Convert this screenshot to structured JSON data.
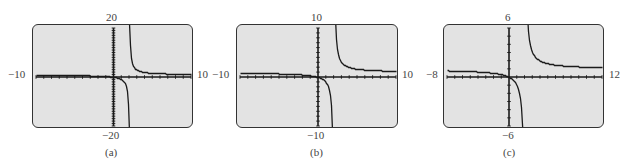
{
  "chart_data": [
    {
      "type": "line",
      "title": "(a)",
      "function": "y = x/(x-2)",
      "xlim": [
        -10,
        10
      ],
      "ylim": [
        -20,
        20
      ],
      "tick_labels": {
        "xmin": "−10",
        "xmax": "10",
        "ymin": "−20",
        "ymax": "20"
      },
      "vertical_asymptote": 2,
      "horizontal_asymptote": 1,
      "grid": false,
      "x_ticks_step": 1,
      "y_ticks_step": 1,
      "samples": [
        [
          -10,
          0.83
        ],
        [
          -5,
          0.71
        ],
        [
          -2,
          0.5
        ],
        [
          -1,
          0.33
        ],
        [
          0,
          0
        ],
        [
          1,
          -1
        ],
        [
          1.5,
          -3
        ],
        [
          1.8,
          -9
        ],
        [
          1.9,
          -19
        ],
        [
          2.1,
          21
        ],
        [
          2.2,
          11
        ],
        [
          2.5,
          5
        ],
        [
          3,
          3
        ],
        [
          4,
          2
        ],
        [
          6,
          1.5
        ],
        [
          10,
          1.25
        ]
      ]
    },
    {
      "type": "line",
      "title": "(b)",
      "function": "y = x/(x-2)",
      "xlim": [
        -10,
        10
      ],
      "ylim": [
        -10,
        10
      ],
      "tick_labels": {
        "xmin": "−10",
        "xmax": "10",
        "ymin": "−10",
        "ymax": "10"
      },
      "vertical_asymptote": 2,
      "horizontal_asymptote": 1,
      "grid": false,
      "x_ticks_step": 1,
      "y_ticks_step": 1,
      "samples": [
        [
          -10,
          0.83
        ],
        [
          -5,
          0.71
        ],
        [
          -2,
          0.5
        ],
        [
          -1,
          0.33
        ],
        [
          0,
          0
        ],
        [
          1,
          -1
        ],
        [
          1.5,
          -3
        ],
        [
          1.8,
          -9
        ],
        [
          2.2,
          11
        ],
        [
          2.5,
          5
        ],
        [
          3,
          3
        ],
        [
          4,
          2
        ],
        [
          6,
          1.5
        ],
        [
          10,
          1.25
        ]
      ]
    },
    {
      "type": "line",
      "title": "(c)",
      "function": "y = x/(x-2)",
      "xlim": [
        -8,
        12
      ],
      "ylim": [
        -6,
        6
      ],
      "tick_labels": {
        "xmin": "−8",
        "xmax": "12",
        "ymin": "−6",
        "ymax": "6"
      },
      "vertical_asymptote": 2,
      "horizontal_asymptote": 1,
      "grid": false,
      "x_ticks_step": 1,
      "y_ticks_step": 1,
      "samples": [
        [
          -8,
          0.8
        ],
        [
          -4,
          0.67
        ],
        [
          -2,
          0.5
        ],
        [
          -1,
          0.33
        ],
        [
          0,
          0
        ],
        [
          1,
          -1
        ],
        [
          1.5,
          -3
        ],
        [
          1.7,
          -5.67
        ],
        [
          2.3,
          7.67
        ],
        [
          2.5,
          5
        ],
        [
          3,
          3
        ],
        [
          4,
          2
        ],
        [
          6,
          1.5
        ],
        [
          8,
          1.33
        ],
        [
          12,
          1.2
        ]
      ]
    }
  ],
  "panels": [
    {
      "caption": "(a)",
      "xmin": "−10",
      "xmax": "10",
      "ymin": "−20",
      "ymax": "20"
    },
    {
      "caption": "(b)",
      "xmin": "−10",
      "xmax": "10",
      "ymin": "−10",
      "ymax": "10"
    },
    {
      "caption": "(c)",
      "xmin": "−8",
      "xmax": "12",
      "ymin": "−6",
      "ymax": "6"
    }
  ],
  "colors": {
    "screen_bg": "#e3e3e3",
    "ink": "#1a1a1a",
    "border": "#333333"
  }
}
